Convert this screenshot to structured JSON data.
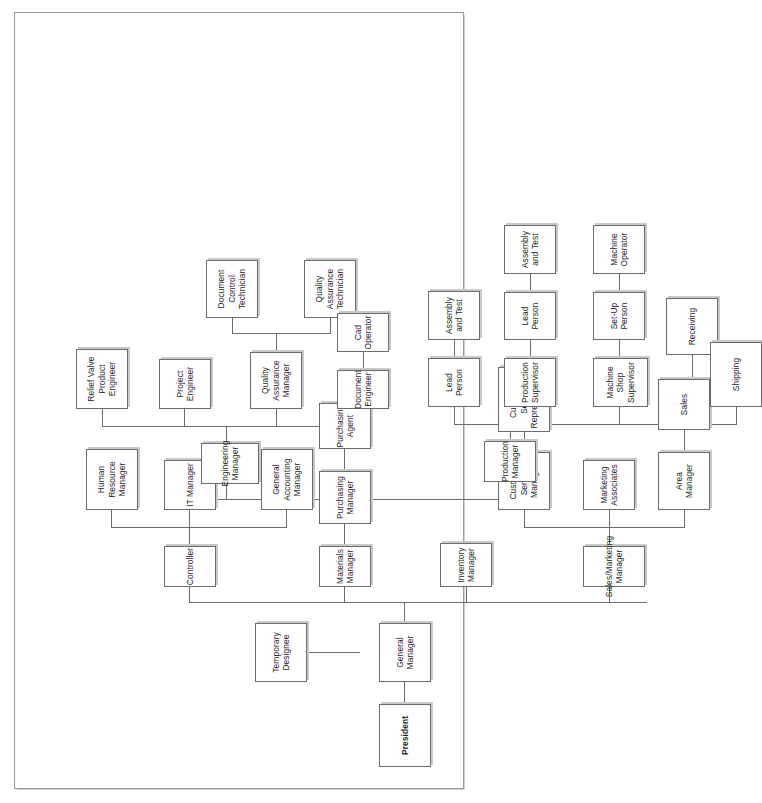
{
  "document": {
    "type": "organizational-chart",
    "title": "Company Organizational Chart",
    "orientation": "landscape-rotated"
  },
  "nodes": {
    "president": "President",
    "general_manager": "General Manager",
    "temporary_designee": "Temporary Designee",
    "controller": "Controller",
    "human_resource_manager": "Human Resource Manager",
    "it_manager": "IT Manager",
    "general_accounting_manager": "General Accounting Manager",
    "materials_manager": "Materials Manager",
    "purchasing_manager": "Purchasing Manager",
    "purchasing_agent": "Purchasing Agent",
    "inventory_manager": "Inventory Manager",
    "sales_marketing_manager": "Sales/Marketing Manager",
    "customer_service_manager": "Customer Service Manager",
    "customer_service_representative": "Customer Service Representative",
    "marketing_associates": "Marketing Associates",
    "area_manager": "Area Manager",
    "sales": "Sales",
    "engineering_manager": "Engineering Manager",
    "relief_valve_product_engineer": "Relief Valve Product Engineer",
    "project_engineer": "Project Engineer",
    "quality_assurance_manager": "Quality Assurance Manager",
    "document_control_technician": "Document Control Technician",
    "quality_assurance_technician": "Quality Assurance Technician",
    "document_engineer": "Document Engineer",
    "cad_operator": "Cad Operator",
    "production_manager": "Production Manager",
    "lead_person_a": "Lead Person",
    "assembly_and_test_a": "Assembly and Test",
    "production_supervisor": "Production Supervisor",
    "lead_person_b": "Lead Person",
    "assembly_and_test_b": "Assembly and Test",
    "machine_shop_supervisor": "Machine Shop Supervisor",
    "set_up_person": "Set-Up Person",
    "machine_operator": "Machine Operator",
    "receiving": "Receiving",
    "shipping": "Shipping"
  },
  "hierarchy": [
    {
      "parent": "President",
      "children": [
        "General Manager"
      ]
    },
    {
      "parent": "General Manager",
      "children": [
        "Temporary Designee",
        "Controller",
        "Materials Manager",
        "Inventory Manager",
        "Sales/Marketing Manager",
        "Engineering Manager",
        "Production Manager"
      ]
    },
    {
      "parent": "Controller",
      "children": [
        "Human Resource Manager",
        "IT Manager",
        "General Accounting Manager"
      ]
    },
    {
      "parent": "Materials Manager",
      "children": [
        "Purchasing Manager"
      ]
    },
    {
      "parent": "Purchasing Manager",
      "children": [
        "Purchasing Agent"
      ]
    },
    {
      "parent": "Sales/Marketing Manager",
      "children": [
        "Customer Service Manager",
        "Marketing Associates",
        "Area Manager"
      ]
    },
    {
      "parent": "Customer Service Manager",
      "children": [
        "Customer Service Representative"
      ]
    },
    {
      "parent": "Area Manager",
      "children": [
        "Sales"
      ]
    },
    {
      "parent": "Engineering Manager",
      "children": [
        "Relief Valve Product Engineer",
        "Project Engineer",
        "Quality Assurance Manager",
        "Document Engineer"
      ]
    },
    {
      "parent": "Quality Assurance Manager",
      "children": [
        "Document Control Technician",
        "Quality Assurance Technician"
      ]
    },
    {
      "parent": "Document Engineer",
      "children": [
        "Cad Operator"
      ]
    },
    {
      "parent": "Production Manager",
      "children": [
        "Lead Person",
        "Production Supervisor",
        "Machine Shop Supervisor",
        "Receiving",
        "Shipping"
      ]
    },
    {
      "parent": "Lead Person",
      "children": [
        "Assembly and Test"
      ]
    },
    {
      "parent": "Production Supervisor",
      "children": [
        "Lead Person"
      ]
    },
    {
      "parent": "Machine Shop Supervisor",
      "children": [
        "Set-Up Person"
      ]
    },
    {
      "parent": "Set-Up Person",
      "children": [
        "Machine Operator"
      ]
    }
  ],
  "colors": {
    "box_border": "#6b6b6b",
    "box_fill": "#ffffff",
    "box_shadow": "#c9c9c9",
    "connector": "#6b6b6b",
    "page_border": "#9a9a9a",
    "text": "#1d1d1d",
    "background": "#ffffff"
  }
}
